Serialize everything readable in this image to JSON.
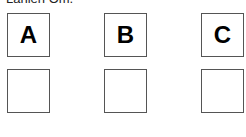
{
  "heading": "Lanien Om.",
  "columns": [
    {
      "label": "A",
      "answer": ""
    },
    {
      "label": "B",
      "answer": ""
    },
    {
      "label": "C",
      "answer": ""
    }
  ]
}
